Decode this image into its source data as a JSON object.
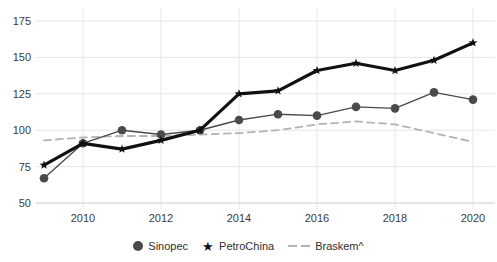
{
  "chart_data": {
    "type": "line",
    "title": "",
    "subtitle": "",
    "xlabel": "",
    "ylabel": "",
    "x": [
      2009,
      2010,
      2011,
      2012,
      2013,
      2014,
      2015,
      2016,
      2017,
      2018,
      2019,
      2020
    ],
    "xtick_labels": [
      "2010",
      "2012",
      "2014",
      "2016",
      "2018",
      "2020"
    ],
    "xticks": [
      2010,
      2012,
      2014,
      2016,
      2018,
      2020
    ],
    "xlim": [
      2009,
      2020
    ],
    "ytick_labels": [
      "50",
      "75",
      "100",
      "125",
      "150",
      "175"
    ],
    "yticks": [
      50,
      75,
      100,
      125,
      150,
      175
    ],
    "ylim": [
      50,
      175
    ],
    "grid": true,
    "legend_position": "bottom",
    "series": [
      {
        "name": "Sinopec",
        "marker": "circle",
        "color": "#4a4a4a",
        "linestyle": "solid",
        "values": [
          67,
          91,
          100,
          97,
          100,
          107,
          111,
          110,
          116,
          115,
          126,
          121
        ]
      },
      {
        "name": "PetroChina",
        "marker": "star",
        "color": "#111111",
        "linestyle": "solid",
        "values": [
          76,
          91,
          87,
          93,
          100,
          125,
          127,
          141,
          146,
          141,
          148,
          160
        ]
      },
      {
        "name": "Braskem^",
        "marker": "none",
        "color": "#b3b3b3",
        "linestyle": "dashed",
        "values": [
          93,
          95,
          96,
          96,
          97,
          98,
          100,
          104,
          106,
          104,
          98,
          92
        ]
      }
    ]
  },
  "legend": {
    "items": [
      {
        "label": "Sinopec",
        "marker": "circle-marker-icon"
      },
      {
        "label": "PetroChina",
        "marker": "star-marker-icon"
      },
      {
        "label": "Braskem^",
        "marker": "dashed-line-icon"
      }
    ]
  },
  "colors": {
    "sinopec": "#4a4a4a",
    "petrochina": "#111111",
    "braskem": "#b3b3b3",
    "grid": "#e6e6e6",
    "text": "#3b3b3b",
    "background": "#ffffff"
  }
}
